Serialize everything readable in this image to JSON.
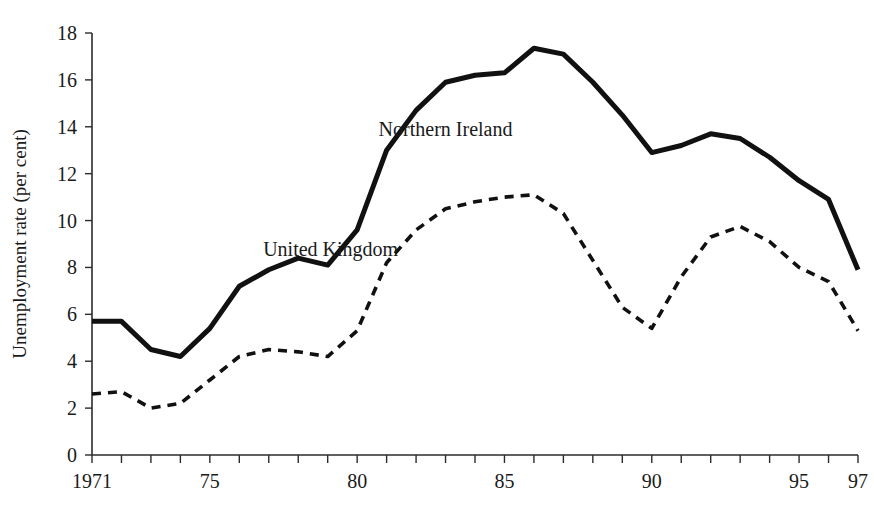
{
  "chart_data": {
    "type": "line",
    "title": "",
    "xlabel": "",
    "ylabel": "Unemployment rate (per cent)",
    "ylim": [
      0,
      18
    ],
    "xlim": [
      1971,
      1997
    ],
    "yticks": [
      0,
      2,
      4,
      6,
      8,
      10,
      12,
      14,
      16,
      18
    ],
    "ytick_labels": [
      "0",
      "2",
      "4",
      "6",
      "8",
      "10",
      "12",
      "14",
      "16",
      "18"
    ],
    "xticks": [
      1971,
      1972,
      1973,
      1974,
      1975,
      1976,
      1977,
      1978,
      1979,
      1980,
      1981,
      1982,
      1983,
      1984,
      1985,
      1986,
      1987,
      1988,
      1989,
      1990,
      1991,
      1992,
      1993,
      1994,
      1995,
      1996,
      1997
    ],
    "xtick_labels_shown": [
      {
        "x": 1971,
        "label": "1971"
      },
      {
        "x": 1975,
        "label": "75"
      },
      {
        "x": 1980,
        "label": "80"
      },
      {
        "x": 1985,
        "label": "85"
      },
      {
        "x": 1990,
        "label": "90"
      },
      {
        "x": 1995,
        "label": "95"
      },
      {
        "x": 1997,
        "label": "97"
      }
    ],
    "grid": false,
    "legend_position": "inline-annotation",
    "x": [
      1971,
      1972,
      1973,
      1974,
      1975,
      1976,
      1977,
      1978,
      1979,
      1980,
      1981,
      1982,
      1983,
      1984,
      1985,
      1986,
      1987,
      1988,
      1989,
      1990,
      1991,
      1992,
      1993,
      1994,
      1995,
      1996,
      1997
    ],
    "series": [
      {
        "name": "Northern Ireland",
        "style": "solid",
        "label_x": 1983.0,
        "label_y": 13.6,
        "values": [
          5.7,
          5.7,
          4.5,
          4.2,
          5.4,
          7.2,
          7.9,
          8.4,
          8.1,
          9.6,
          13.0,
          14.7,
          15.9,
          16.2,
          16.3,
          17.35,
          17.1,
          15.9,
          14.5,
          12.9,
          13.2,
          13.7,
          13.5,
          12.7,
          11.7,
          10.9,
          7.9
        ]
      },
      {
        "name": "United Kingdom",
        "style": "dashed",
        "label_x": 1979.1,
        "label_y": 8.5,
        "values": [
          2.6,
          2.7,
          2.0,
          2.2,
          3.2,
          4.2,
          4.5,
          4.4,
          4.2,
          5.3,
          8.2,
          9.6,
          10.5,
          10.8,
          11.0,
          11.1,
          10.3,
          8.3,
          6.3,
          5.4,
          7.6,
          9.3,
          9.75,
          9.1,
          8.0,
          7.4,
          5.3
        ]
      }
    ]
  }
}
